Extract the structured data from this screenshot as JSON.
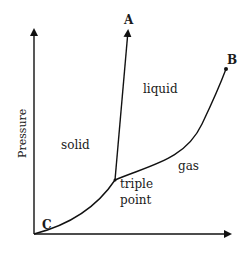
{
  "diagram": {
    "y_axis_label": "Pressure",
    "x_axis_label": "",
    "regions": {
      "solid": "solid",
      "liquid": "liquid",
      "gas": "gas"
    },
    "points": {
      "A": "A",
      "B": "B",
      "C": "C",
      "triple_line1": "triple",
      "triple_line2": "point"
    },
    "colors": {
      "line": "#111111",
      "background": "#ffffff"
    }
  }
}
